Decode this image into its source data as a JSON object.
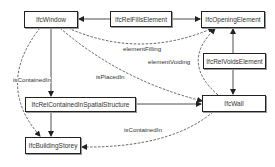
{
  "diagram": {
    "nodes": {
      "window": {
        "label": "IfcWindow"
      },
      "rel_fills": {
        "label": "IfcRelFillsElement"
      },
      "opening": {
        "label": "IfcOpeningElement"
      },
      "rel_voids": {
        "label": "IfcRelVoidsElement"
      },
      "rel_contained": {
        "label": "IfcRelContainedInSpatialStructure"
      },
      "wall": {
        "label": "IfcWall"
      },
      "storey": {
        "label": "IfcBuildingStorey"
      }
    },
    "edge_labels": {
      "element_filling": "elementFilling",
      "element_voiding": "elementVoiding",
      "is_placed_in": "isPlacedIn",
      "is_contained_in_window": "isContainedIn",
      "is_contained_in_wall": "isContainedIn"
    },
    "colors": {
      "stroke": "#222222",
      "text": "#333333",
      "background": "#ffffff"
    }
  }
}
